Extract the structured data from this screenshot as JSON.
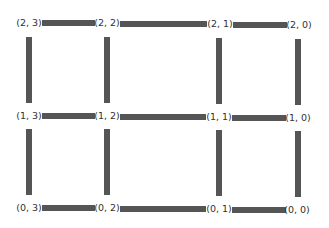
{
  "graph": {
    "type": "grid_2d_graph",
    "rows": 3,
    "cols": 4,
    "edge_color": "#555555",
    "label_color": "#333333",
    "nodes": [
      {
        "id": "2,3",
        "label": "(2, 3)",
        "x": 29,
        "y": 23
      },
      {
        "id": "2,2",
        "label": "(2, 2)",
        "x": 107,
        "y": 23
      },
      {
        "id": "2,1",
        "label": "(2, 1)",
        "x": 220,
        "y": 24
      },
      {
        "id": "2,0",
        "label": "(2, 0)",
        "x": 299,
        "y": 25
      },
      {
        "id": "1,3",
        "label": "(1, 3)",
        "x": 29,
        "y": 116
      },
      {
        "id": "1,2",
        "label": "(1, 2)",
        "x": 107,
        "y": 116
      },
      {
        "id": "1,1",
        "label": "(1, 1)",
        "x": 219,
        "y": 117
      },
      {
        "id": "1,0",
        "label": "(1, 0)",
        "x": 298,
        "y": 118
      },
      {
        "id": "0,3",
        "label": "(0, 3)",
        "x": 29,
        "y": 208
      },
      {
        "id": "0,2",
        "label": "(0, 2)",
        "x": 107,
        "y": 208
      },
      {
        "id": "0,1",
        "label": "(0, 1)",
        "x": 219,
        "y": 209
      },
      {
        "id": "0,0",
        "label": "(0, 0)",
        "x": 297,
        "y": 210
      }
    ],
    "h_edges": [
      {
        "from": "2,3",
        "to": "2,2",
        "x": 42,
        "y": 20,
        "w": 53,
        "h": 6
      },
      {
        "from": "2,2",
        "to": "2,1",
        "x": 120,
        "y": 21,
        "w": 87,
        "h": 6
      },
      {
        "from": "2,1",
        "to": "2,0",
        "x": 233,
        "y": 22,
        "w": 54,
        "h": 6
      },
      {
        "from": "1,3",
        "to": "1,2",
        "x": 42,
        "y": 113,
        "w": 53,
        "h": 6
      },
      {
        "from": "1,2",
        "to": "1,1",
        "x": 120,
        "y": 114,
        "w": 86,
        "h": 6
      },
      {
        "from": "1,1",
        "to": "1,0",
        "x": 232,
        "y": 115,
        "w": 54,
        "h": 6
      },
      {
        "from": "0,3",
        "to": "0,2",
        "x": 42,
        "y": 205,
        "w": 53,
        "h": 6
      },
      {
        "from": "0,2",
        "to": "0,1",
        "x": 120,
        "y": 206,
        "w": 86,
        "h": 6
      },
      {
        "from": "0,1",
        "to": "0,0",
        "x": 232,
        "y": 207,
        "w": 54,
        "h": 6
      }
    ],
    "v_edges": [
      {
        "from": "2,3",
        "to": "1,3",
        "x": 26,
        "y": 37,
        "w": 6,
        "h": 66
      },
      {
        "from": "2,2",
        "to": "1,2",
        "x": 104,
        "y": 37,
        "w": 6,
        "h": 66
      },
      {
        "from": "2,1",
        "to": "1,1",
        "x": 216,
        "y": 38,
        "w": 6,
        "h": 66
      },
      {
        "from": "2,0",
        "to": "1,0",
        "x": 295,
        "y": 39,
        "w": 6,
        "h": 66
      },
      {
        "from": "1,3",
        "to": "0,3",
        "x": 26,
        "y": 129,
        "w": 6,
        "h": 66
      },
      {
        "from": "1,2",
        "to": "0,2",
        "x": 104,
        "y": 129,
        "w": 6,
        "h": 66
      },
      {
        "from": "1,1",
        "to": "0,1",
        "x": 216,
        "y": 130,
        "w": 6,
        "h": 66
      },
      {
        "from": "1,0",
        "to": "0,0",
        "x": 295,
        "y": 131,
        "w": 6,
        "h": 66
      }
    ]
  }
}
